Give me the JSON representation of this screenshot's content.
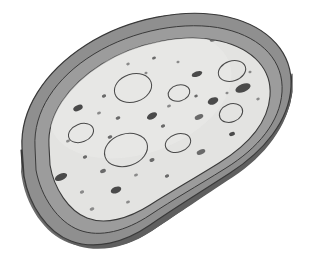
{
  "canvas": {
    "width": 310,
    "height": 277,
    "background": "#ffffff"
  },
  "illustration": {
    "title": "Bean-shaped porous slab, three-quarter view",
    "subject": "sponge-like kidney-bean slab with speckled interior and oval pores",
    "style": "grayscale line illustration with flat shaded bands"
  },
  "palette": {
    "background": "#ffffff",
    "side_wall_dark": "#6e6e6e",
    "side_wall_shadow": "#5f5f5f",
    "rim_top_mid_gray": "#8f8f8f",
    "rim_top_light": "#9a9a9a",
    "interior_fill": "#e3e3e1",
    "interior_fill_light": "#ebebe9",
    "outline_stroke": "#3a3a3a",
    "pore_outline": "#4a4a4a",
    "speck_dark": "#4a4a4a",
    "speck_mid": "#6a6a6a",
    "speck_light": "#8a8a8a"
  },
  "geometry": {
    "outer_bean_path": "M 22 148 C 20 110, 44 72, 86 45 C 128 18, 184 8, 226 17 C 268 26, 292 52, 291 86 C 290 120, 266 150, 232 172 C 198 194, 176 206, 150 224 C 124 242, 96 250, 72 242 C 48 234, 30 206, 24 176 Z",
    "side_wall_depth_px": 22,
    "rim_band_width_px": 14,
    "perspective": "isometric-ish, light from upper left"
  },
  "layers": [
    {
      "name": "side-wall",
      "label": "Side wall (thickness)",
      "fill": "#6e6e6e"
    },
    {
      "name": "rim-band",
      "label": "Top rim band",
      "fill": "#8f8f8f"
    },
    {
      "name": "interior",
      "label": "Porous interior surface",
      "fill": "#e3e3e1"
    }
  ],
  "pores": [
    {
      "cx": 133,
      "cy": 88,
      "rx": 19,
      "ry": 14,
      "rot": -18
    },
    {
      "cx": 179,
      "cy": 93,
      "rx": 11,
      "ry": 8,
      "rot": -15
    },
    {
      "cx": 232,
      "cy": 71,
      "rx": 14,
      "ry": 10,
      "rot": -18
    },
    {
      "cx": 231,
      "cy": 113,
      "rx": 12,
      "ry": 9,
      "rot": -22
    },
    {
      "cx": 81,
      "cy": 133,
      "rx": 13,
      "ry": 9,
      "rot": -22
    },
    {
      "cx": 126,
      "cy": 150,
      "rx": 22,
      "ry": 16,
      "rot": -18
    },
    {
      "cx": 178,
      "cy": 143,
      "rx": 13,
      "ry": 9,
      "rot": -18
    }
  ],
  "specks": [
    {
      "cx": 214,
      "cy": 39,
      "rx": 4.5,
      "ry": 2.2,
      "rot": -22,
      "tone": "speck_mid"
    },
    {
      "cx": 154,
      "cy": 58,
      "rx": 2.0,
      "ry": 1.4,
      "rot": -20,
      "tone": "speck_mid"
    },
    {
      "cx": 178,
      "cy": 62,
      "rx": 1.6,
      "ry": 1.2,
      "rot": -20,
      "tone": "speck_light"
    },
    {
      "cx": 197,
      "cy": 74,
      "rx": 5.5,
      "ry": 2.6,
      "rot": -20,
      "tone": "speck_dark"
    },
    {
      "cx": 250,
      "cy": 72,
      "rx": 1.6,
      "ry": 1.2,
      "rot": -20,
      "tone": "speck_light"
    },
    {
      "cx": 78,
      "cy": 108,
      "rx": 5.0,
      "ry": 2.8,
      "rot": -24,
      "tone": "speck_dark"
    },
    {
      "cx": 104,
      "cy": 96,
      "rx": 2.2,
      "ry": 1.6,
      "rot": -20,
      "tone": "speck_mid"
    },
    {
      "cx": 99,
      "cy": 113,
      "rx": 2.0,
      "ry": 1.4,
      "rot": -20,
      "tone": "speck_light"
    },
    {
      "cx": 118,
      "cy": 118,
      "rx": 2.4,
      "ry": 1.6,
      "rot": -20,
      "tone": "speck_mid"
    },
    {
      "cx": 152,
      "cy": 116,
      "rx": 5.5,
      "ry": 3.0,
      "rot": -28,
      "tone": "speck_dark"
    },
    {
      "cx": 163,
      "cy": 126,
      "rx": 2.2,
      "ry": 1.6,
      "rot": -20,
      "tone": "speck_mid"
    },
    {
      "cx": 196,
      "cy": 96,
      "rx": 1.8,
      "ry": 1.4,
      "rot": -20,
      "tone": "speck_mid"
    },
    {
      "cx": 213,
      "cy": 101,
      "rx": 5.5,
      "ry": 3.4,
      "rot": -22,
      "tone": "speck_dark"
    },
    {
      "cx": 243,
      "cy": 88,
      "rx": 8.0,
      "ry": 4.0,
      "rot": -22,
      "tone": "speck_dark"
    },
    {
      "cx": 227,
      "cy": 93,
      "rx": 1.6,
      "ry": 1.2,
      "rot": -20,
      "tone": "speck_light"
    },
    {
      "cx": 199,
      "cy": 117,
      "rx": 4.5,
      "ry": 2.4,
      "rot": -22,
      "tone": "speck_mid"
    },
    {
      "cx": 232,
      "cy": 134,
      "rx": 3.0,
      "ry": 2.0,
      "rot": -22,
      "tone": "speck_dark"
    },
    {
      "cx": 68,
      "cy": 141,
      "rx": 2.0,
      "ry": 1.4,
      "rot": -20,
      "tone": "speck_light"
    },
    {
      "cx": 110,
      "cy": 137,
      "rx": 2.4,
      "ry": 1.6,
      "rot": -20,
      "tone": "speck_mid"
    },
    {
      "cx": 85,
      "cy": 157,
      "rx": 2.2,
      "ry": 1.6,
      "rot": -20,
      "tone": "speck_mid"
    },
    {
      "cx": 152,
      "cy": 160,
      "rx": 2.6,
      "ry": 1.8,
      "rot": -20,
      "tone": "speck_mid"
    },
    {
      "cx": 201,
      "cy": 152,
      "rx": 4.5,
      "ry": 2.4,
      "rot": -22,
      "tone": "speck_mid"
    },
    {
      "cx": 103,
      "cy": 171,
      "rx": 3.0,
      "ry": 2.0,
      "rot": -24,
      "tone": "speck_mid"
    },
    {
      "cx": 61,
      "cy": 177,
      "rx": 6.5,
      "ry": 3.4,
      "rot": -24,
      "tone": "speck_dark"
    },
    {
      "cx": 82,
      "cy": 192,
      "rx": 2.2,
      "ry": 1.6,
      "rot": -20,
      "tone": "speck_light"
    },
    {
      "cx": 116,
      "cy": 190,
      "rx": 5.5,
      "ry": 3.2,
      "rot": -22,
      "tone": "speck_dark"
    },
    {
      "cx": 136,
      "cy": 175,
      "rx": 2.0,
      "ry": 1.4,
      "rot": -20,
      "tone": "speck_light"
    },
    {
      "cx": 167,
      "cy": 176,
      "rx": 2.2,
      "ry": 1.6,
      "rot": -20,
      "tone": "speck_mid"
    },
    {
      "cx": 62,
      "cy": 205,
      "rx": 2.2,
      "ry": 1.6,
      "rot": -20,
      "tone": "speck_light"
    },
    {
      "cx": 92,
      "cy": 209,
      "rx": 2.4,
      "ry": 1.6,
      "rot": -20,
      "tone": "speck_light"
    },
    {
      "cx": 128,
      "cy": 202,
      "rx": 2.0,
      "ry": 1.4,
      "rot": -20,
      "tone": "speck_light"
    },
    {
      "cx": 176,
      "cy": 194,
      "rx": 2.6,
      "ry": 1.8,
      "rot": -20,
      "tone": "speck_mid"
    },
    {
      "cx": 146,
      "cy": 73,
      "rx": 1.6,
      "ry": 1.2,
      "rot": -20,
      "tone": "speck_light"
    },
    {
      "cx": 169,
      "cy": 106,
      "rx": 2.0,
      "ry": 1.4,
      "rot": -20,
      "tone": "speck_light"
    },
    {
      "cx": 128,
      "cy": 64,
      "rx": 1.8,
      "ry": 1.3,
      "rot": -20,
      "tone": "speck_light"
    },
    {
      "cx": 258,
      "cy": 99,
      "rx": 1.8,
      "ry": 1.3,
      "rot": -20,
      "tone": "speck_light"
    }
  ]
}
